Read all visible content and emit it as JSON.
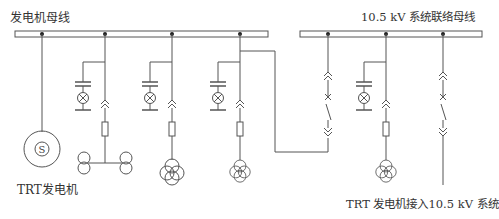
{
  "labels": {
    "gen_bus": "发电机母线",
    "sys_bus": "10.5 kV 系统联络母线",
    "generator": "TRT发电机",
    "connection": "TRT 发电机接入10.5 kV 系统"
  },
  "colors": {
    "line": "#555555",
    "bus_fill": "#ffffff",
    "node": "#222222"
  },
  "components": {
    "generator_symbol": "S",
    "buses": [
      "发电机母线",
      "10.5 kV 系统联络母线"
    ],
    "feeders": [
      {
        "bus": "gen",
        "x": 42,
        "type": "generator"
      },
      {
        "bus": "gen",
        "x": 105,
        "type": "two-winding-transformers-pair"
      },
      {
        "bus": "gen",
        "x": 172,
        "type": "three-winding-transformer"
      },
      {
        "bus": "gen",
        "x": 240,
        "type": "three-winding-transformer-tie"
      },
      {
        "bus": "sys",
        "x": 328,
        "type": "tie-breaker"
      },
      {
        "bus": "sys",
        "x": 386,
        "type": "three-winding-transformer"
      },
      {
        "bus": "sys",
        "x": 443,
        "type": "outgoing-breaker"
      }
    ]
  }
}
